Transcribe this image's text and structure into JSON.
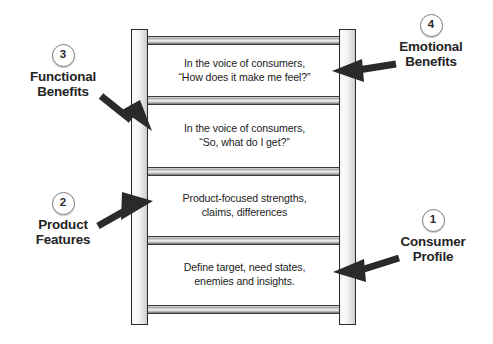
{
  "diagram": {
    "colors": {
      "rail_fill": "#efefef",
      "rail_outline": "#2b2b2b",
      "rung_highlight": "#efefef",
      "rung_shadow": "#6f6f6f",
      "text": "#1c1c1c",
      "label_text": "#242424",
      "circle_border": "#7d7d7d",
      "arrow": "#2a2a2a",
      "background": "#ffffff"
    },
    "steps": [
      {
        "id": "emotional-benefits",
        "number": "4",
        "text": "In the voice of consumers,\n“How does it make me feel?”"
      },
      {
        "id": "functional-benefits",
        "number": "3",
        "text": "In the voice of consumers,\n“So, what do I get?”"
      },
      {
        "id": "product-features",
        "number": "2",
        "text": "Product-focused strengths,\nclaims, differences"
      },
      {
        "id": "consumer-profile",
        "number": "1",
        "text": "Define target, need states,\nenemies and insights."
      }
    ],
    "callouts": [
      {
        "id": "emotional-benefits",
        "number": "4",
        "label": "Emotional\nBenefits",
        "side": "right"
      },
      {
        "id": "functional-benefits",
        "number": "3",
        "label": "Functional\nBenefits",
        "side": "left"
      },
      {
        "id": "product-features",
        "number": "2",
        "label": "Product\nFeatures",
        "side": "left"
      },
      {
        "id": "consumer-profile",
        "number": "1",
        "label": "Consumer\nProfile",
        "side": "right"
      }
    ]
  }
}
